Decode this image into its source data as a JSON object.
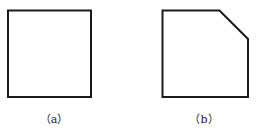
{
  "figures": [
    {
      "id": "a",
      "label": "（a）",
      "shape": "square"
    },
    {
      "id": "b",
      "label": "（b）",
      "shape": "square-with-cut-corner"
    }
  ],
  "colors": {
    "stroke": "#1a1a1a",
    "background": "#ffffff"
  }
}
